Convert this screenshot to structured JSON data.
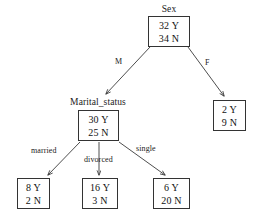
{
  "diagram": {
    "type": "decision-tree",
    "line_color": "#3a3a3a",
    "box_border_color": "#333333",
    "text_color": "#111111",
    "background": "#ffffff"
  },
  "nodes": {
    "root": {
      "title": "Sex",
      "yes": "32 Y",
      "no": "34 N"
    },
    "marital": {
      "title": "Marital_status",
      "yes": "30 Y",
      "no": "25 N"
    },
    "leaf_female": {
      "title": "",
      "yes": "2 Y",
      "no": "9 N"
    },
    "leaf_married": {
      "title": "",
      "yes": "8 Y",
      "no": "2 N"
    },
    "leaf_divorced": {
      "title": "",
      "yes": "16 Y",
      "no": "3 N"
    },
    "leaf_single": {
      "title": "",
      "yes": "6 Y",
      "no": "20 N"
    }
  },
  "edges": {
    "male": "M",
    "female": "F",
    "married": "married",
    "divorced": "divorced",
    "single": "single"
  }
}
